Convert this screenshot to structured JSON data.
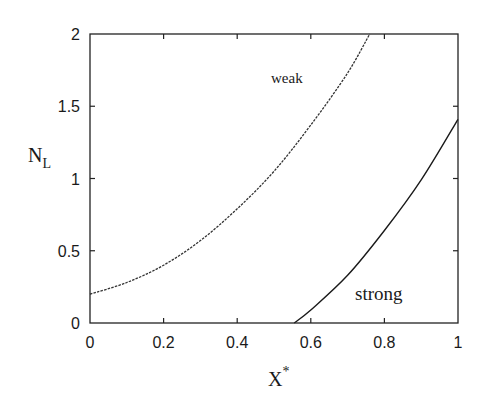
{
  "chart_data": {
    "type": "line",
    "title": "",
    "xlabel": "X*",
    "xlabel_main": "X",
    "xlabel_sup": "*",
    "ylabel": "N_L",
    "ylabel_main": "N",
    "ylabel_sub": "L",
    "xlim": [
      0,
      1
    ],
    "ylim": [
      0,
      2
    ],
    "grid": false,
    "legend": "none (inline curve labels)",
    "x_ticks": [
      0,
      0.2,
      0.4,
      0.6,
      0.8,
      1
    ],
    "x_tick_labels": [
      "0",
      "0.2",
      "0.4",
      "0.6",
      "0.8",
      "1"
    ],
    "y_ticks": [
      0,
      0.5,
      1,
      1.5,
      2
    ],
    "y_tick_labels": [
      "0",
      "0.5",
      "1",
      "1.5",
      "2"
    ],
    "series": [
      {
        "name": "weak",
        "style": "dashed",
        "color": "#333333",
        "x": [
          0.0,
          0.1,
          0.2,
          0.3,
          0.4,
          0.5,
          0.6,
          0.7,
          0.76
        ],
        "y": [
          0.2,
          0.28,
          0.4,
          0.57,
          0.79,
          1.05,
          1.37,
          1.73,
          2.0
        ]
      },
      {
        "name": "strong",
        "style": "solid",
        "color": "#1a1a1a",
        "x": [
          0.555,
          0.6,
          0.7,
          0.8,
          0.9,
          1.0
        ],
        "y": [
          0.0,
          0.09,
          0.33,
          0.64,
          0.99,
          1.41
        ]
      }
    ],
    "annotations": [
      {
        "text": "weak",
        "x": 0.49,
        "y": 1.66
      },
      {
        "text": "strong",
        "x": 0.72,
        "y": 0.16
      }
    ]
  },
  "labels": {
    "weak": "weak",
    "strong": "strong"
  }
}
